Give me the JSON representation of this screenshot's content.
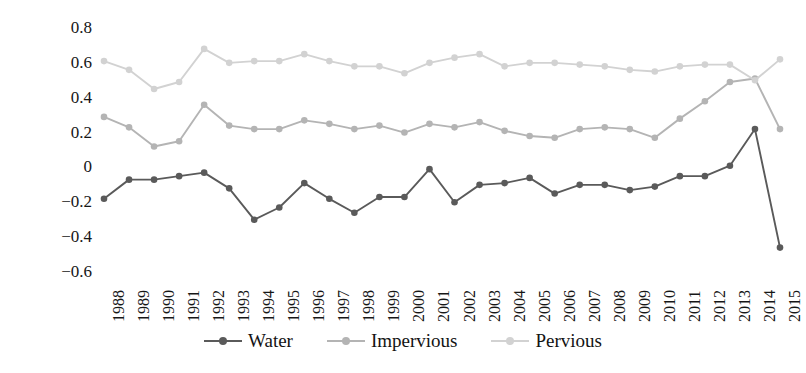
{
  "chart_data": {
    "type": "line",
    "title": "",
    "subtitle": "",
    "xlabel": "",
    "ylabel": "",
    "grid": false,
    "legend_position": "bottom-center",
    "ylim": [
      -0.6,
      0.8
    ],
    "yticks": [
      "0.8",
      "0.6",
      "0.4",
      "0.2",
      "0",
      "−0.2",
      "−0.4",
      "−0.6"
    ],
    "ytick_values": [
      0.8,
      0.6,
      0.4,
      0.2,
      0,
      -0.2,
      -0.4,
      -0.6
    ],
    "categories": [
      "1988",
      "1989",
      "1990",
      "1991",
      "1992",
      "1993",
      "1994",
      "1995",
      "1996",
      "1997",
      "1998",
      "1999",
      "2000",
      "2001",
      "2002",
      "2003",
      "2004",
      "2005",
      "2006",
      "2007",
      "2008",
      "2009",
      "2010",
      "2011",
      "2012",
      "2013",
      "2014",
      "2015"
    ],
    "series": [
      {
        "name": "Water",
        "color": "#5a5a5a",
        "values": [
          -0.18,
          -0.07,
          -0.07,
          -0.05,
          -0.03,
          -0.12,
          -0.3,
          -0.23,
          -0.09,
          -0.18,
          -0.26,
          -0.17,
          -0.17,
          -0.01,
          -0.2,
          -0.1,
          -0.09,
          -0.06,
          -0.15,
          -0.1,
          -0.1,
          -0.13,
          -0.11,
          -0.05,
          -0.05,
          0.01,
          0.22,
          -0.46
        ]
      },
      {
        "name": "Impervious",
        "color": "#b4b4b4",
        "values": [
          0.29,
          0.23,
          0.12,
          0.15,
          0.36,
          0.24,
          0.22,
          0.22,
          0.27,
          0.25,
          0.22,
          0.24,
          0.2,
          0.25,
          0.23,
          0.26,
          0.21,
          0.18,
          0.17,
          0.22,
          0.23,
          0.22,
          0.17,
          0.28,
          0.38,
          0.49,
          0.51,
          0.22
        ]
      },
      {
        "name": "Pervious",
        "color": "#d2d2d2",
        "values": [
          0.61,
          0.56,
          0.45,
          0.49,
          0.68,
          0.6,
          0.61,
          0.61,
          0.65,
          0.61,
          0.58,
          0.58,
          0.54,
          0.6,
          0.63,
          0.65,
          0.58,
          0.6,
          0.6,
          0.59,
          0.58,
          0.56,
          0.55,
          0.58,
          0.59,
          0.59,
          0.5,
          0.62
        ]
      }
    ]
  },
  "legend": {
    "entries": [
      {
        "label": "Water",
        "color": "#5a5a5a"
      },
      {
        "label": "Impervious",
        "color": "#b4b4b4"
      },
      {
        "label": "Pervious",
        "color": "#d2d2d2"
      }
    ]
  }
}
